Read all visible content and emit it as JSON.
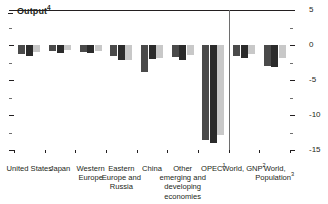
{
  "title": {
    "text": "Output",
    "superscript": "4"
  },
  "chart_data": {
    "type": "bar",
    "title": "Output",
    "title_footnote": "4",
    "xlabel": "",
    "ylabel": "",
    "ylim": [
      -15,
      5
    ],
    "y_axis_position": "right",
    "grid": false,
    "legend": "none",
    "zero_line": true,
    "y_ticks_major": [
      5,
      0,
      -5,
      -10,
      -15
    ],
    "y_ticks_major_labels": [
      "5",
      "0",
      "-5",
      "-10",
      "-15"
    ],
    "y_ticks_minor": [
      2.5,
      -2.5,
      -7.5,
      -12.5
    ],
    "categories": [
      "United States",
      "Japan",
      "Western Europe",
      "Eastern Europe and Russia",
      "China",
      "Other emerging and developing economies",
      "OPEC",
      "World, GNP",
      "World, Population"
    ],
    "category_footnotes": [
      "",
      "",
      "",
      "",
      "",
      "",
      "1",
      "2",
      "3"
    ],
    "separator_after_category_index": 6,
    "series": [
      {
        "name": "series-1",
        "color": "#4a4a4a",
        "values": [
          -1.3,
          -0.9,
          -1.0,
          -1.6,
          -3.9,
          -1.7,
          -13.5,
          -1.6,
          -3.0
        ]
      },
      {
        "name": "series-2",
        "color": "#2b2b2b",
        "values": [
          -1.6,
          -1.2,
          -1.2,
          -2.2,
          -2.0,
          -2.2,
          -14.0,
          -1.9,
          -3.2
        ]
      },
      {
        "name": "series-3",
        "color": "#c8c8c8",
        "values": [
          -1.0,
          -0.7,
          -0.9,
          -2.1,
          -1.8,
          -1.4,
          -12.8,
          -1.3,
          -1.9
        ]
      }
    ]
  }
}
